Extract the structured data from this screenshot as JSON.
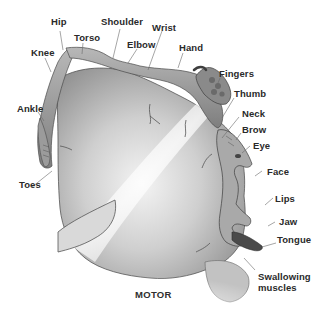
{
  "diagram": {
    "title": "MOTOR",
    "labels": {
      "hip": "Hip",
      "torso": "Torso",
      "shoulder": "Shoulder",
      "wrist": "Wrist",
      "knee": "Knee",
      "elbow": "Elbow",
      "hand": "Hand",
      "fingers": "Fingers",
      "thumb": "Thumb",
      "neck": "Neck",
      "brow": "Brow",
      "eye": "Eye",
      "face": "Face",
      "lips": "Lips",
      "jaw": "Jaw",
      "tongue": "Tongue",
      "ankle": "Ankle",
      "toes": "Toes",
      "swallowing_line1": "Swallowing",
      "swallowing_line2": "muscles"
    },
    "colors": {
      "background": "#ffffff",
      "label_text": "#2a2a2a",
      "leader_line": "#6a6a6a",
      "cortex_dark": "#7d7d7d",
      "cortex_mid": "#a9a9a9",
      "cortex_light": "#e6e6e6",
      "body_figure": "#8f8f8f"
    }
  }
}
